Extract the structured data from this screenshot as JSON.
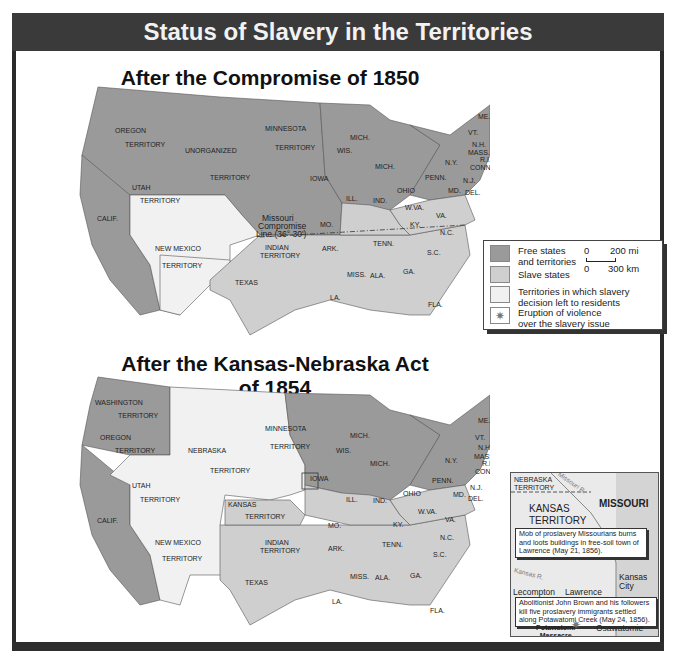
{
  "header": {
    "title": "Status of Slavery in the Territories"
  },
  "maps": [
    {
      "title": "After the Compromise of 1850",
      "labels": {
        "oregon": "OREGON",
        "oregon_t": "TERRITORY",
        "unorganized": "UNORGANIZED",
        "unorganized_t": "TERRITORY",
        "minnesota": "MINNESOTA",
        "minnesota_t": "TERRITORY",
        "utah": "UTAH",
        "utah_t": "TERRITORY",
        "newmexico": "NEW MEXICO",
        "newmexico_t": "TERRITORY",
        "calif": "CALIF.",
        "texas": "TEXAS",
        "indian": "INDIAN",
        "indian_t": "TERRITORY",
        "iowa": "IOWA",
        "wis": "WIS.",
        "mich1": "MICH.",
        "mich2": "MICH.",
        "ill": "ILL.",
        "ind": "IND.",
        "ohio": "OHIO",
        "mo": "MO.",
        "ark": "ARK.",
        "la": "LA.",
        "miss": "MISS.",
        "ala": "ALA.",
        "ga": "GA.",
        "fla": "FLA.",
        "tenn": "TENN.",
        "ky": "KY.",
        "wva": "W.VA.",
        "va": "VA.",
        "nc": "N.C.",
        "sc": "S.C.",
        "penn": "PENN.",
        "ny": "N.Y.",
        "nj": "N.J.",
        "md": "MD.",
        "del": "DEL.",
        "vt": "VT.",
        "nh": "N.H.",
        "mass": "MASS.",
        "ri": "R.I.",
        "conn": "CONN.",
        "me": "ME.",
        "mc1": "Missouri",
        "mc2": "Compromise",
        "mc3": "Line (36° 30')"
      }
    },
    {
      "title": "After the Kansas-Nebraska Act of 1854",
      "labels": {
        "washington": "WASHINGTON",
        "washington_t": "TERRITORY",
        "oregon": "OREGON",
        "oregon_t": "TERRITORY",
        "nebraska": "NEBRASKA",
        "nebraska_t": "TERRITORY",
        "kansas": "KANSAS",
        "kansas_t": "TERRITORY",
        "minnesota": "MINNESOTA",
        "minnesota_t": "TERRITORY",
        "utah": "UTAH",
        "utah_t": "TERRITORY",
        "newmexico": "NEW MEXICO",
        "newmexico_t": "TERRITORY",
        "calif": "CALIF.",
        "texas": "TEXAS",
        "indian": "INDIAN",
        "indian_t": "TERRITORY",
        "iowa": "IOWA",
        "wis": "WIS.",
        "mich1": "MICH.",
        "mich2": "MICH.",
        "ill": "ILL.",
        "ind": "IND.",
        "ohio": "OHIO",
        "mo": "MO.",
        "ark": "ARK.",
        "la": "LA.",
        "miss": "MISS.",
        "ala": "ALA.",
        "ga": "GA.",
        "fla": "FLA.",
        "tenn": "TENN.",
        "ky": "KY.",
        "wva": "W.VA.",
        "va": "VA.",
        "nc": "N.C.",
        "sc": "S.C.",
        "penn": "PENN.",
        "ny": "N.Y.",
        "nj": "N.J.",
        "md": "MD.",
        "del": "DEL.",
        "vt": "VT.",
        "nh": "N.H.",
        "mass": "MASS.",
        "ri": "R.I.",
        "conn": "CONN.",
        "me": "ME."
      }
    }
  ],
  "legend": {
    "items": [
      {
        "label": "Free states and territories",
        "line1": "Free states",
        "line2": "and territories",
        "color": "#9a9a9a"
      },
      {
        "label": "Slave states",
        "line1": "Slave states",
        "line2": "",
        "color": "#cfcfcf"
      },
      {
        "label": "Territories in which slavery decision left to residents",
        "line1": "Territories in which slavery",
        "line2": "decision left to residents",
        "color": "#f1f1f1"
      },
      {
        "label": "Eruption of violence over the slavery issue",
        "line1": "Eruption of violence",
        "line2": "over the slavery issue",
        "icon": "starburst-icon"
      }
    ],
    "scale": {
      "mi_zero": "0",
      "mi": "200 mi",
      "km_zero": "0",
      "km": "300 km"
    }
  },
  "inset": {
    "nebraska": "NEBRASKA",
    "nebraska_t": "TERRITORY",
    "missouri_r": "Missouri R.",
    "missouri": "MISSOURI",
    "kansas": "KANSAS",
    "kansas_t": "TERRITORY",
    "kansas_r": "Kansas R.",
    "note1": "Mob of proslavery Missourians burns and loots buildings in free-soil town of Lawrence (May 21, 1856).",
    "note2": "Abolitionist John Brown and his followers kill five proslavery immigrants settled along Potawatomi Creek (May 24, 1856).",
    "lecompton": "Lecompton",
    "lawrence": "Lawrence",
    "kansas_city": "Kansas City",
    "osawatomie": "Osawatomie",
    "massacre1": "Potawatomi",
    "massacre2": "Massacre"
  },
  "colors": {
    "free": "#9a9a9a",
    "slave": "#cfcfcf",
    "open": "#f1f1f1",
    "lakes": "#e0e0e0",
    "header": "#3a3a3a"
  }
}
